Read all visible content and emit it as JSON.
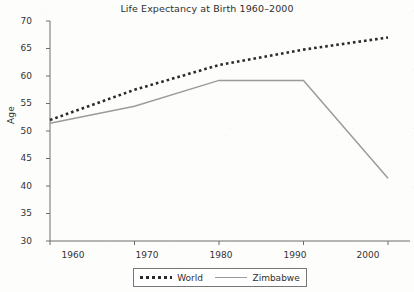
{
  "chart_data": {
    "type": "line",
    "title": "Life Expectancy at Birth 1960–2000",
    "xlabel": "",
    "ylabel": "Age",
    "x": [
      1960,
      1970,
      1980,
      1990,
      2000
    ],
    "xtick_labels": [
      "1960",
      "1970",
      "1980",
      "1990",
      "2000"
    ],
    "ytick_labels": [
      "30",
      "35",
      "40",
      "45",
      "50",
      "55",
      "60",
      "65",
      "70"
    ],
    "yticks": [
      30,
      35,
      40,
      45,
      50,
      55,
      60,
      65,
      70
    ],
    "ylim": [
      30,
      70
    ],
    "xlim": [
      1960,
      2000
    ],
    "grid": false,
    "legend_position": "bottom",
    "series": [
      {
        "name": "World",
        "style": "dotted",
        "color": "#2a2a2a",
        "values": [
          52.0,
          57.5,
          62.0,
          64.8,
          67.0
        ]
      },
      {
        "name": "Zimbabwe",
        "style": "solid",
        "color": "#9b9b9b",
        "values": [
          51.4,
          54.5,
          59.2,
          59.2,
          41.4
        ]
      }
    ]
  },
  "axes": {
    "axis_color": "#6e6e6e",
    "text_color": "#2f2f2f"
  },
  "legend": {
    "entries": [
      {
        "label": "World",
        "swatch": "dotted-line-swatch"
      },
      {
        "label": "Zimbabwe",
        "swatch": "solid-line-swatch"
      }
    ]
  }
}
